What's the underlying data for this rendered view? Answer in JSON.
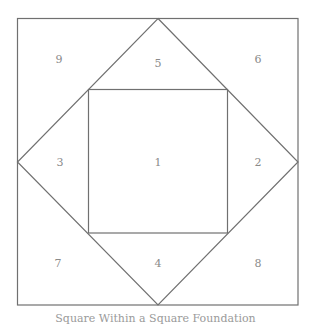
{
  "diagram": {
    "caption": "Square Within a Square Foundation",
    "stroke_color": "#707070",
    "label_color": "#8a8a8a",
    "outer_square": {
      "x1": 17,
      "y1": 18,
      "x2": 298,
      "y2": 305
    },
    "diamond": {
      "top": [
        158,
        18
      ],
      "right": [
        298,
        162
      ],
      "bottom": [
        158,
        305
      ],
      "left": [
        17,
        162
      ]
    },
    "inner_square": {
      "x1": 88,
      "y1": 89,
      "x2": 227,
      "y2": 233
    },
    "pieces": [
      {
        "id": "1",
        "label": "1",
        "region": "center-square",
        "x": 158,
        "y": 162
      },
      {
        "id": "2",
        "label": "2",
        "region": "right-triangle",
        "x": 258,
        "y": 162
      },
      {
        "id": "3",
        "label": "3",
        "region": "left-triangle",
        "x": 60,
        "y": 162
      },
      {
        "id": "4",
        "label": "4",
        "region": "bottom-triangle",
        "x": 158,
        "y": 263
      },
      {
        "id": "5",
        "label": "5",
        "region": "top-triangle",
        "x": 158,
        "y": 63
      },
      {
        "id": "6",
        "label": "6",
        "region": "top-right-corner",
        "x": 258,
        "y": 59
      },
      {
        "id": "7",
        "label": "7",
        "region": "bottom-left-corner",
        "x": 58,
        "y": 263
      },
      {
        "id": "8",
        "label": "8",
        "region": "bottom-right-corner",
        "x": 258,
        "y": 263
      },
      {
        "id": "9",
        "label": "9",
        "region": "top-left-corner",
        "x": 59,
        "y": 59
      }
    ]
  }
}
